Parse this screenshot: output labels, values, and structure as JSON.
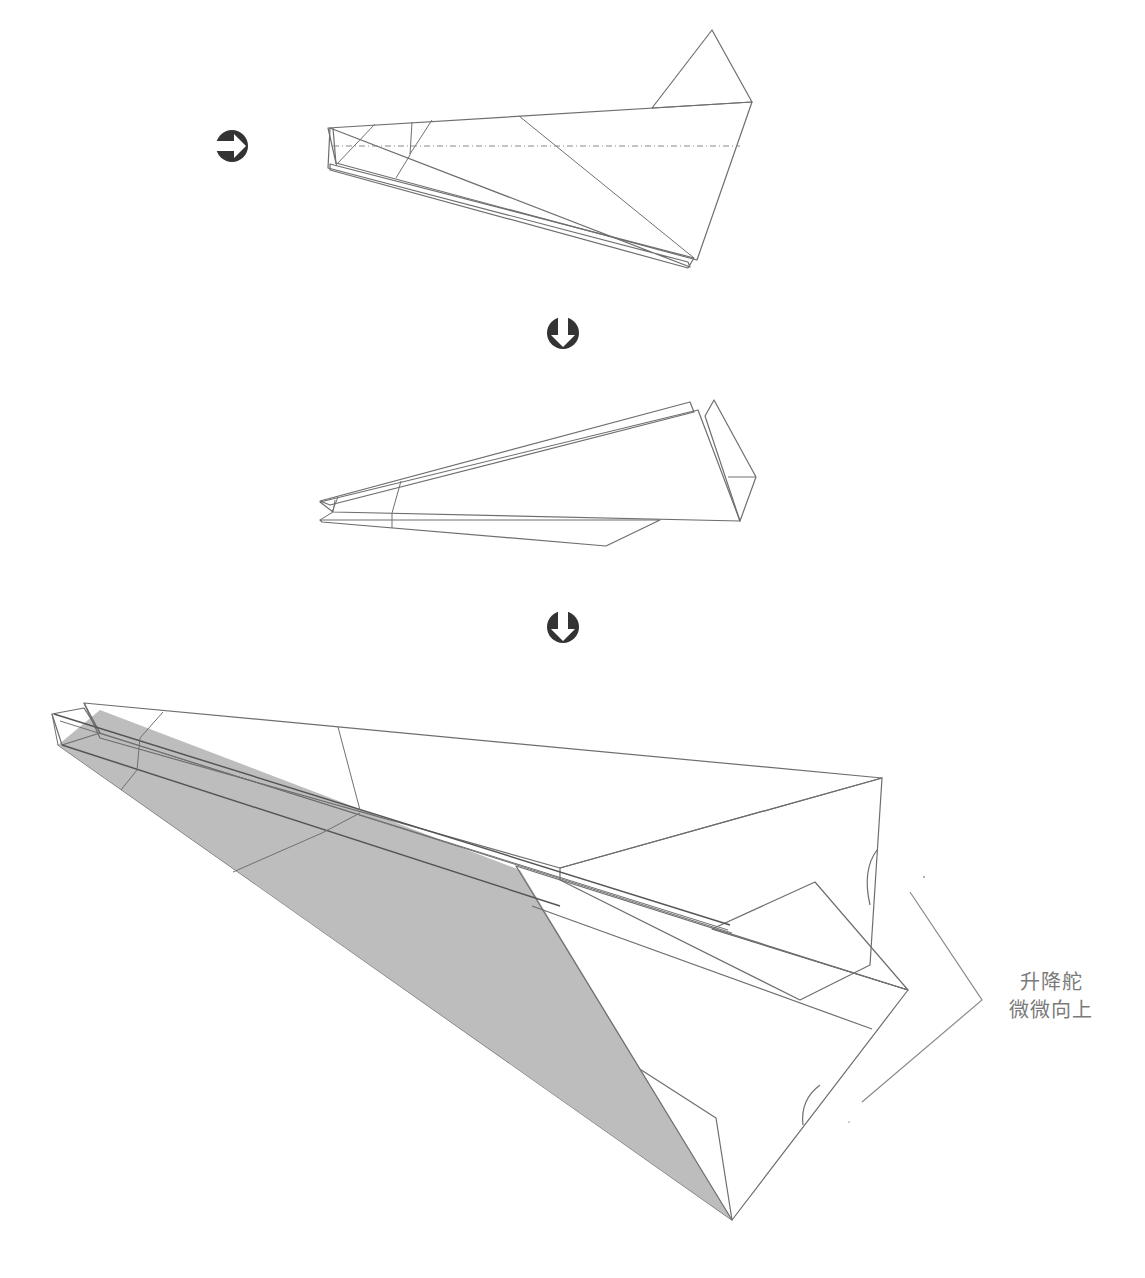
{
  "diagram": {
    "type": "origami-instructions",
    "steps": [
      {
        "index": 1,
        "description": "folded plane, side view",
        "marker_before": "turn-over-arrow"
      },
      {
        "index": 2,
        "description": "wings opened, side view",
        "marker_before": "down-arrow"
      },
      {
        "index": 3,
        "description": "finished plane, perspective view",
        "marker_before": "down-arrow"
      }
    ],
    "markers": {
      "turn_over": {
        "icon": "circled-right-arrow-icon",
        "meaning": "turn over"
      },
      "next_step_1": {
        "icon": "circled-down-arrow-icon",
        "meaning": "next step"
      },
      "next_step_2": {
        "icon": "circled-down-arrow-icon",
        "meaning": "next step"
      }
    },
    "annotation": {
      "line1": "升降舵",
      "line2": "微微向上"
    },
    "colors": {
      "paper_gray": "#bdbdbd",
      "paper_white": "#ececec",
      "line": "#6e6e6e",
      "marker": "#333333",
      "label_text": "#7a7a7a"
    }
  }
}
